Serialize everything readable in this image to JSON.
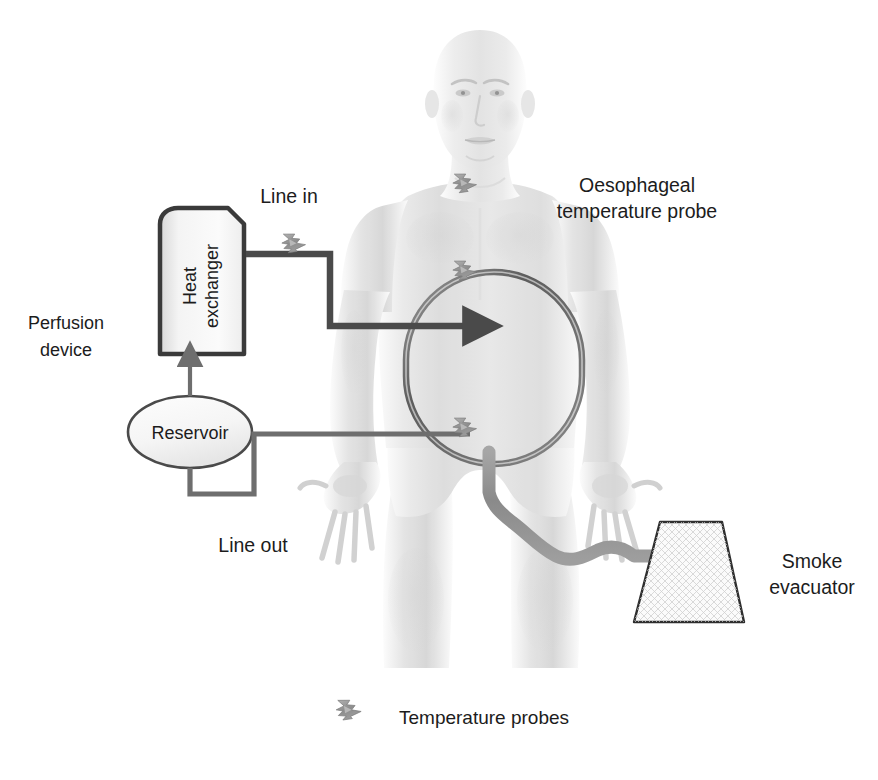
{
  "diagram": {
    "background_color": "#ffffff",
    "colors": {
      "label_text": "#1c1c1c",
      "tube_dark": "#4a4a4a",
      "tube_mid": "#6e6e6e",
      "hose_gray": "#8e8e8e",
      "body_light": "#e9e9e9",
      "body_shade": "#cfcfcf",
      "cavity_outline": "#6a6a6a",
      "probe_gray": "#9a9a9a",
      "box_fill": "#f2f2f2",
      "box_stroke": "#3a3a3a"
    },
    "labels": {
      "perfusion_device": "Perfusion\ndevice",
      "perfusion_device_line1": "Perfusion",
      "perfusion_device_line2": "device",
      "heat_exchanger_line1": "Heat",
      "heat_exchanger_line2": "exchanger",
      "reservoir": "Reservoir",
      "line_in": "Line in",
      "line_out": "Line out",
      "oesophageal_line1": "Oesophageal",
      "oesophageal_line2": "temperature probe",
      "smoke_evacuator_line1": "Smoke",
      "smoke_evacuator_line2": "evacuator",
      "legend_temperature_probes": "Temperature probes"
    },
    "components": [
      {
        "id": "heat-exchanger",
        "name": "Heat exchanger",
        "shape": "rounded-top box"
      },
      {
        "id": "reservoir",
        "name": "Reservoir",
        "shape": "ellipse"
      },
      {
        "id": "peritoneal-cavity",
        "name": "Peritoneal cavity",
        "shape": "stadium outline"
      },
      {
        "id": "smoke-evacuator",
        "name": "Smoke evacuator",
        "shape": "trapezoid with mesh"
      },
      {
        "id": "patient",
        "name": "Patient figure",
        "shape": "anatomical grayscale"
      }
    ],
    "flow": {
      "line_in_direction": "right",
      "line_in_arrowhead": true,
      "line_out_arrowhead": false,
      "reservoir_to_exchanger_arrowhead": true
    },
    "probe_markers": [
      {
        "name": "oesophageal-probe",
        "x": 465,
        "y": 188
      },
      {
        "name": "line-in-probe",
        "x": 294,
        "y": 248
      },
      {
        "name": "cavity-upper-probe",
        "x": 465,
        "y": 275
      },
      {
        "name": "cavity-lower-probe",
        "x": 465,
        "y": 432
      }
    ],
    "legend": {
      "icon": "lightning-bolt-probe-icon",
      "text": "Temperature probes"
    }
  }
}
